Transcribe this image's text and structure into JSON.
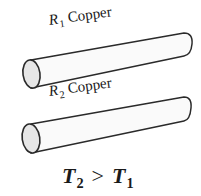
{
  "figure": {
    "rods": [
      {
        "id": "rod-1",
        "resistor_symbol": "R",
        "resistor_subscript": "1",
        "material": "Copper"
      },
      {
        "id": "rod-2",
        "resistor_symbol": "R",
        "resistor_subscript": "2",
        "material": "Copper"
      }
    ],
    "relation": {
      "left_symbol": "T",
      "left_subscript": "2",
      "operator": ">",
      "right_symbol": "T",
      "right_subscript": "1"
    },
    "colors": {
      "outline": "#2a2a2a",
      "rod_fill": "#fafafa",
      "end_cap_fill": "#e6e6e6",
      "text": "#1a1a1a"
    }
  }
}
